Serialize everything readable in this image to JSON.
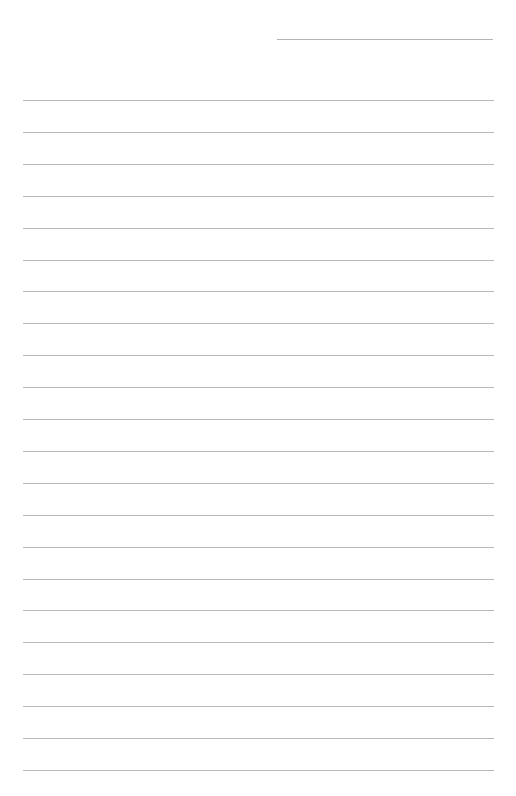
{
  "page": {
    "type": "lined-writing-paper",
    "background": "#ffffff",
    "line_color": "#b8b8b8",
    "header_line": {
      "x": 277,
      "y": 39,
      "width": 216
    },
    "rules": {
      "count": 22,
      "first_y": 100,
      "spacing": 31.9,
      "x": 23,
      "width": 471
    }
  }
}
